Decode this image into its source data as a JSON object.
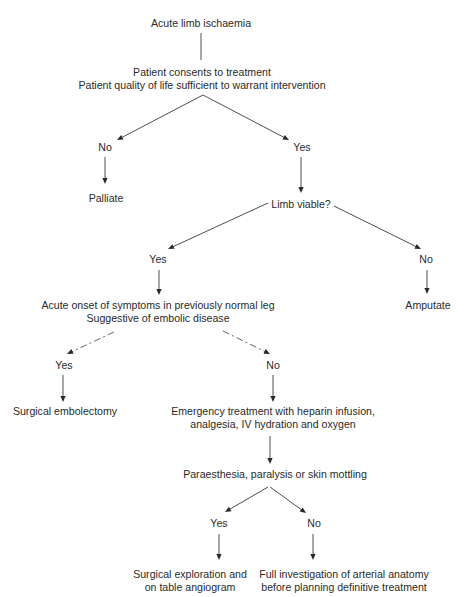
{
  "diagram": {
    "title": "Acute limb ischaemia",
    "nodes": [
      {
        "id": "root",
        "lines": [
          "Acute limb ischaemia"
        ],
        "x": 201,
        "y": 17
      },
      {
        "id": "consent",
        "lines": [
          "Patient consents to treatment",
          "Patient quality of life sufficient to warrant intervention"
        ],
        "x": 202,
        "y": 66
      },
      {
        "id": "no1",
        "lines": [
          "No"
        ],
        "x": 105,
        "y": 141
      },
      {
        "id": "yes1",
        "lines": [
          "Yes"
        ],
        "x": 302,
        "y": 141
      },
      {
        "id": "palliate",
        "lines": [
          "Palliate"
        ],
        "x": 106,
        "y": 192
      },
      {
        "id": "viable",
        "lines": [
          "Limb viable?"
        ],
        "x": 301,
        "y": 198
      },
      {
        "id": "yes2",
        "lines": [
          "Yes"
        ],
        "x": 158,
        "y": 253
      },
      {
        "id": "no2",
        "lines": [
          "No"
        ],
        "x": 426,
        "y": 253
      },
      {
        "id": "embolic",
        "lines": [
          "Acute onset of symptoms in previously normal leg",
          "Suggestive of embolic disease"
        ],
        "x": 158,
        "y": 299
      },
      {
        "id": "amputate",
        "lines": [
          "Amputate"
        ],
        "x": 428,
        "y": 299
      },
      {
        "id": "yes3",
        "lines": [
          "Yes"
        ],
        "x": 64,
        "y": 359
      },
      {
        "id": "no3",
        "lines": [
          "No"
        ],
        "x": 273,
        "y": 359
      },
      {
        "id": "embolectomy",
        "lines": [
          "Surgical embolectomy"
        ],
        "x": 65,
        "y": 405
      },
      {
        "id": "emergency",
        "lines": [
          "Emergency treatment with heparin infusion,",
          "analgesia, IV hydration and oxygen"
        ],
        "x": 273,
        "y": 405
      },
      {
        "id": "paraesthesia",
        "lines": [
          "Paraesthesia, paralysis or skin mottling"
        ],
        "x": 275,
        "y": 468
      },
      {
        "id": "yes4",
        "lines": [
          "Yes"
        ],
        "x": 219,
        "y": 517
      },
      {
        "id": "no4",
        "lines": [
          "No"
        ],
        "x": 314,
        "y": 517
      },
      {
        "id": "exploration",
        "lines": [
          "Surgical exploration and",
          "on table angiogram"
        ],
        "x": 190,
        "y": 568
      },
      {
        "id": "investigation",
        "lines": [
          "Full investigation of arterial anatomy",
          "before planning definitive treatment"
        ],
        "x": 344,
        "y": 568
      }
    ],
    "edges": [
      {
        "from": "root",
        "to": "consent",
        "points": [
          [
            201,
            33
          ],
          [
            201,
            60
          ]
        ],
        "arrow": false,
        "style": "solid"
      },
      {
        "from": "consent",
        "to": "no1",
        "points": [
          [
            203,
            95
          ],
          [
            117,
            140
          ]
        ],
        "arrow": true,
        "style": "solid"
      },
      {
        "from": "consent",
        "to": "yes1",
        "points": [
          [
            203,
            95
          ],
          [
            289,
            140
          ]
        ],
        "arrow": true,
        "style": "solid"
      },
      {
        "from": "no1",
        "to": "palliate",
        "points": [
          [
            105,
            157
          ],
          [
            105,
            184
          ]
        ],
        "arrow": true,
        "style": "solid"
      },
      {
        "from": "yes1",
        "to": "viable",
        "points": [
          [
            301,
            157
          ],
          [
            301,
            193
          ]
        ],
        "arrow": true,
        "style": "solid"
      },
      {
        "from": "viable",
        "to": "yes2",
        "points": [
          [
            268,
            203
          ],
          [
            168,
            249
          ]
        ],
        "arrow": true,
        "style": "solid"
      },
      {
        "from": "viable",
        "to": "no2",
        "points": [
          [
            334,
            206
          ],
          [
            421,
            249
          ]
        ],
        "arrow": true,
        "style": "solid"
      },
      {
        "from": "yes2",
        "to": "embolic",
        "points": [
          [
            159,
            270
          ],
          [
            159,
            295
          ]
        ],
        "arrow": true,
        "style": "solid"
      },
      {
        "from": "no2",
        "to": "amputate",
        "points": [
          [
            427,
            270
          ],
          [
            427,
            294
          ]
        ],
        "arrow": true,
        "style": "solid"
      },
      {
        "from": "embolic",
        "to": "yes3",
        "points": [
          [
            114,
            332
          ],
          [
            67,
            354
          ]
        ],
        "arrow": true,
        "style": "dashed"
      },
      {
        "from": "embolic",
        "to": "no3",
        "points": [
          [
            223,
            331
          ],
          [
            270,
            354
          ]
        ],
        "arrow": true,
        "style": "dashed"
      },
      {
        "from": "yes3",
        "to": "embolectomy",
        "points": [
          [
            63,
            375
          ],
          [
            63,
            402
          ]
        ],
        "arrow": true,
        "style": "solid"
      },
      {
        "from": "no3",
        "to": "emergency",
        "points": [
          [
            273,
            375
          ],
          [
            273,
            402
          ]
        ],
        "arrow": true,
        "style": "solid"
      },
      {
        "from": "emergency",
        "to": "paraesthesia",
        "points": [
          [
            270,
            436
          ],
          [
            270,
            464
          ]
        ],
        "arrow": true,
        "style": "solid"
      },
      {
        "from": "paraesthesia",
        "to": "yes4",
        "points": [
          [
            268,
            487
          ],
          [
            225,
            512
          ]
        ],
        "arrow": true,
        "style": "solid"
      },
      {
        "from": "paraesthesia",
        "to": "no4",
        "points": [
          [
            270,
            487
          ],
          [
            306,
            513
          ]
        ],
        "arrow": true,
        "style": "solid"
      },
      {
        "from": "yes4",
        "to": "exploration",
        "points": [
          [
            219,
            534
          ],
          [
            219,
            560
          ]
        ],
        "arrow": true,
        "style": "solid"
      },
      {
        "from": "no4",
        "to": "investigation",
        "points": [
          [
            313,
            534
          ],
          [
            313,
            560
          ]
        ],
        "arrow": true,
        "style": "solid"
      }
    ]
  }
}
